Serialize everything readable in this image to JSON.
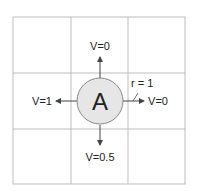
{
  "diagram": {
    "type": "grid-world-state-transitions",
    "grid": {
      "rows": 3,
      "cols": 3,
      "line_color": "#bdbdbd"
    },
    "agent": {
      "label": "A",
      "fill": "#e6e6e6",
      "stroke": "#888888"
    },
    "neighbors": {
      "up": "V=0",
      "left": "V=1",
      "right": "V=0",
      "down": "V=0.5"
    },
    "reward_label": "r = 1"
  }
}
